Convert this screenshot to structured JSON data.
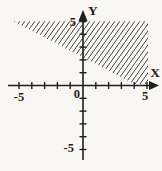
{
  "figure": {
    "background_color": "#f8f7f4",
    "ink_color": "#1e1e1e",
    "hatch_color": "#454545"
  },
  "chart_data": {
    "type": "area",
    "title": "",
    "xlabel": "X",
    "ylabel": "Y",
    "xlim": [
      -5,
      5
    ],
    "ylim": [
      -5,
      5
    ],
    "grid": false,
    "x_axis": {
      "label": "X",
      "tick_values": [
        -5,
        -4,
        -3,
        -2,
        -1,
        1,
        2,
        3,
        4,
        5
      ],
      "labeled_ticks": [
        {
          "value": -5,
          "text": "-5"
        },
        {
          "value": 0,
          "text": "0"
        },
        {
          "value": 5,
          "text": "5"
        }
      ]
    },
    "y_axis": {
      "label": "Y",
      "tick_values": [
        -5,
        -4,
        -3,
        -2,
        -1,
        1,
        2,
        3,
        4,
        5
      ],
      "labeled_ticks": [
        {
          "value": 5,
          "text": "5"
        },
        {
          "value": -5,
          "text": "-5"
        }
      ]
    },
    "region": {
      "style": "diagonal-hatch",
      "shaded_side": "above boundary line",
      "boundary_points_graph": [
        [
          0,
          2
        ],
        [
          4,
          0
        ]
      ],
      "polygon_graph": [
        [
          -5.45,
          5.02
        ],
        [
          5.08,
          5.02
        ],
        [
          5.08,
          0.12
        ],
        [
          4.02,
          0.12
        ]
      ]
    },
    "layout": {
      "origin_px": [
        83,
        85.5
      ],
      "px_per_unit": 12.8,
      "x_axis_start_px": 8,
      "x_axis_end_px": 150,
      "x_arrow_tip_px": 159,
      "y_axis_start_px": 160,
      "y_axis_end_px": 20,
      "y_arrow_tip_px": 10,
      "tick_half_len_px": 3.5,
      "arrow_half_width_px": 4.5,
      "hatch_tile_px": [
        5,
        7
      ],
      "hatch_stroke_px": 1
    }
  }
}
